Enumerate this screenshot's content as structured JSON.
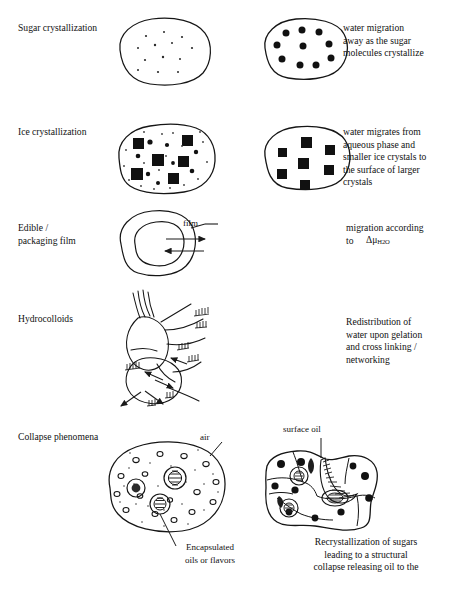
{
  "document": {
    "type": "scientific-schematic-figure",
    "background_color": "#ffffff",
    "ink_color": "#111111"
  },
  "rows": [
    {
      "id": "sugar-crystallization",
      "left_label": "Sugar crystallization",
      "right_label": "water migration\n away as the sugar\nmolecules crystallize",
      "before_figure": {
        "name": "sugar-blob-dispersed",
        "description": "rounded blob outline with many tiny scattered dots",
        "marker": "small-dot",
        "marker_count": 13
      },
      "after_figure": {
        "name": "sugar-blob-crystallized",
        "description": "rounded blob outline with nine large filled circles in a ring plus centre",
        "marker": "large-dot",
        "marker_count": 9
      }
    },
    {
      "id": "ice-crystallization",
      "left_label": "Ice crystallization",
      "right_label": "water migrates from\naqueous phase and\nsmaller ice crystals to\nthe surface of larger\ncrystals",
      "before_figure": {
        "name": "ice-blob-mixed",
        "description": "blob with six large filled squares, several medium dots and many tiny specks",
        "marker": "square-and-dot",
        "large_square_count": 6,
        "medium_dot_count": 8,
        "speck_count": 18
      },
      "after_figure": {
        "name": "ice-blob-large-crystals",
        "description": "blob with seven evenly spread filled squares",
        "marker": "square",
        "square_count": 7
      }
    },
    {
      "id": "edible-packaging-film",
      "left_label": "Edible /\npackaging film",
      "right_label": "migration according\nto",
      "right_label_symbol_prefix": "Δμ",
      "right_label_symbol_subscript": "H2O",
      "callout_label": "film",
      "figure": {
        "name": "film-coated-particle",
        "description": "irregular outer film ring enclosing an inner core, two horizontal arrows crossing the film in opposite directions, leader line to the word film"
      }
    },
    {
      "id": "hydrocolloids",
      "left_label": "Hydrocolloids",
      "right_label": "Redistribution of\nwater upon gelation\nand cross linking /\nnetworking",
      "figure": {
        "name": "hydrocolloid-network",
        "description": "hand drawn network of gel strands and lobes with hatch marks and arrows radiating outward"
      }
    },
    {
      "id": "collapse-phenomena",
      "left_label": "Collapse phenomena",
      "callout_air": "air",
      "callout_encapsulated": "Encapsulated\noils or flavors",
      "callout_surface_oil": "surface oil",
      "right_caption": "Recrystallization of sugars\n leading to a structural\ncollapse releasing oil to the",
      "before_figure": {
        "name": "porous-matrix-with-capsules",
        "description": "rounded matrix speckled with small open air voids and three hatched encapsulated oil droplets",
        "air_void_count": 16,
        "capsule_count": 3
      },
      "after_figure": {
        "name": "collapsed-matrix-surface-oil",
        "description": "collapsed angular matrix with internal cells, filled oil droplets and a hatched surface oil channel reaching the top surface"
      }
    }
  ]
}
